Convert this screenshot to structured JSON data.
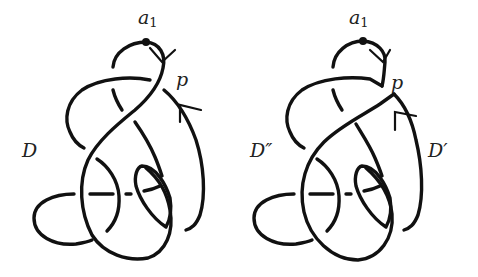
{
  "figure": {
    "background": "#ffffff",
    "stroke_color": "#111111",
    "panels": [
      {
        "id": "left",
        "diagram_label": "D",
        "basepoint_label": "a",
        "basepoint_subscript": "1",
        "crossing_label": "p"
      },
      {
        "id": "right",
        "diagram_label_left": "D″",
        "diagram_label_right": "D′",
        "basepoint_label": "a",
        "basepoint_subscript": "1",
        "crossing_label": "p"
      }
    ]
  }
}
